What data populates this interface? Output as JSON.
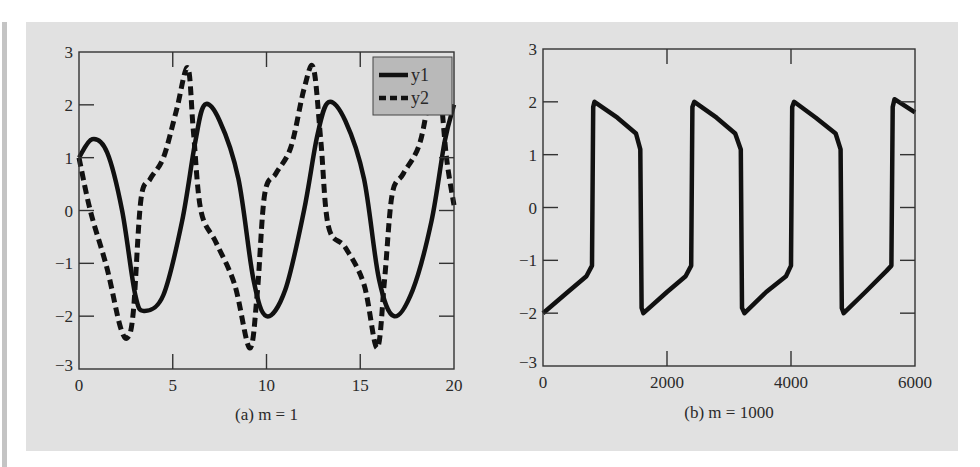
{
  "chart_data": [
    {
      "type": "line",
      "title": "",
      "caption": "(a) m = 1",
      "xlabel": "",
      "ylabel": "",
      "xlim": [
        0,
        20
      ],
      "ylim": [
        -3,
        3
      ],
      "xticks": [
        0,
        5,
        10,
        15,
        20
      ],
      "yticks": [
        -3,
        -2,
        -1,
        0,
        1,
        2,
        3
      ],
      "grid": false,
      "legend": {
        "position": "upper right",
        "entries": [
          "y1",
          "y2"
        ]
      },
      "series": [
        {
          "name": "y1",
          "style": "solid",
          "x": [
            0,
            0.7,
            1.5,
            2.3,
            3.0,
            3.5,
            4.5,
            5.5,
            6.2,
            6.7,
            7.5,
            8.5,
            9.3,
            10.0,
            11.0,
            12.0,
            12.7,
            13.3,
            14.2,
            15.2,
            16.0,
            16.8,
            17.8,
            18.8,
            19.5,
            20.0
          ],
          "y": [
            1.0,
            1.35,
            1.1,
            0.0,
            -1.6,
            -1.9,
            -1.6,
            -0.2,
            1.3,
            2.0,
            1.7,
            0.6,
            -1.3,
            -2.0,
            -1.5,
            0.0,
            1.4,
            2.05,
            1.7,
            0.6,
            -1.3,
            -2.0,
            -1.5,
            -0.2,
            1.3,
            2.0
          ]
        },
        {
          "name": "y2",
          "style": "dashed",
          "x": [
            0,
            0.6,
            1.5,
            2.2,
            2.6,
            2.9,
            3.3,
            3.8,
            4.5,
            5.2,
            5.8,
            6.1,
            6.5,
            7.3,
            8.3,
            9.1,
            9.5,
            9.9,
            10.5,
            11.3,
            12.0,
            12.5,
            12.9,
            13.3,
            14.2,
            15.2,
            15.9,
            16.3,
            16.7,
            17.3,
            18.2,
            18.9,
            19.2,
            19.6,
            20.0
          ],
          "y": [
            1.0,
            0.0,
            -1.1,
            -2.2,
            -2.4,
            -1.9,
            0.2,
            0.6,
            1.0,
            1.9,
            2.7,
            1.5,
            0.0,
            -0.6,
            -1.4,
            -2.6,
            -1.6,
            0.3,
            0.7,
            1.2,
            2.3,
            2.7,
            1.3,
            -0.3,
            -0.7,
            -1.4,
            -2.6,
            -1.3,
            0.3,
            0.7,
            1.3,
            2.6,
            2.5,
            1.0,
            0.1
          ]
        }
      ]
    },
    {
      "type": "line",
      "title": "",
      "caption": "(b) m = 1000",
      "xlabel": "",
      "ylabel": "",
      "xlim": [
        0,
        6000
      ],
      "ylim": [
        -3,
        3
      ],
      "xticks": [
        0,
        2000,
        4000,
        6000
      ],
      "yticks": [
        -3,
        -2,
        -1,
        0,
        1,
        2,
        3
      ],
      "grid": false,
      "series": [
        {
          "name": "y1",
          "style": "solid",
          "x": [
            0,
            400,
            700,
            790,
            810,
            830,
            1200,
            1500,
            1570,
            1590,
            1620,
            2000,
            2300,
            2390,
            2410,
            2440,
            2800,
            3100,
            3190,
            3210,
            3250,
            3600,
            3920,
            4000,
            4020,
            4050,
            4400,
            4720,
            4800,
            4820,
            4850,
            5200,
            5540,
            5620,
            5640,
            5670,
            6000
          ],
          "y": [
            -2.0,
            -1.6,
            -1.3,
            -1.1,
            1.9,
            2.0,
            1.7,
            1.4,
            1.1,
            -1.9,
            -2.0,
            -1.6,
            -1.3,
            -1.1,
            1.9,
            2.0,
            1.7,
            1.4,
            1.1,
            -1.9,
            -2.0,
            -1.6,
            -1.3,
            -1.1,
            1.9,
            2.0,
            1.7,
            1.4,
            1.1,
            -1.9,
            -2.0,
            -1.6,
            -1.2,
            -1.1,
            1.9,
            2.05,
            1.8
          ]
        }
      ]
    }
  ]
}
